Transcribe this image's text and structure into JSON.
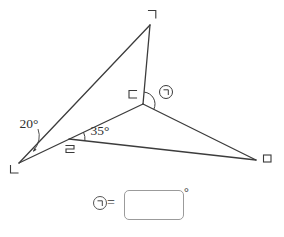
{
  "colors": {
    "line": "#3c3c3c",
    "glyph": "#3a3a3a",
    "text": "#2f2f2f",
    "box_border": "#9b9b9b",
    "background": "#ffffff"
  },
  "figure": {
    "vertices": [
      {
        "position": "top",
        "label": "ㄱ"
      },
      {
        "position": "bottom-left",
        "label": "ㄴ"
      },
      {
        "position": "center",
        "label": "ㄷ"
      },
      {
        "position": "point-on-segment",
        "label": "ㄹ"
      },
      {
        "position": "right",
        "label": "ㅁ"
      }
    ],
    "angles": [
      {
        "vertex": "ㄴ",
        "label": "20°"
      },
      {
        "vertex": "ㄹ",
        "label": "35°"
      },
      {
        "vertex": "ㄷ",
        "label": "㉠"
      }
    ]
  },
  "answer": {
    "label": "㉠",
    "equals_sign": "=",
    "input_value": "",
    "unit": "°"
  }
}
